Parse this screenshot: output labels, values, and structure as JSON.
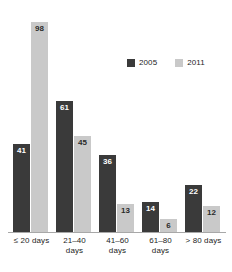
{
  "chart_data": {
    "type": "bar",
    "title": "",
    "subtitle": "",
    "xlabel": "",
    "ylabel": "",
    "grid": false,
    "legend_position": "top-right",
    "ylim": [
      0,
      98
    ],
    "categories": [
      "≤ 20 days",
      "21–40 days",
      "41–60 days",
      "61–80 days",
      "> 80 days"
    ],
    "category_lines": [
      [
        "≤ 20 days"
      ],
      [
        "21–40",
        "days"
      ],
      [
        "41–60",
        "days"
      ],
      [
        "61–80",
        "days"
      ],
      [
        "> 80 days"
      ]
    ],
    "series": [
      {
        "name": "2005",
        "color": "#3a3a3a",
        "values": [
          41,
          61,
          36,
          14,
          22
        ]
      },
      {
        "name": "2011",
        "color": "#c9c9c9",
        "values": [
          98,
          45,
          13,
          6,
          12
        ]
      }
    ]
  },
  "legend": {
    "entries": [
      {
        "label": "2005",
        "color": "#3a3a3a"
      },
      {
        "label": "2011",
        "color": "#c9c9c9"
      }
    ]
  },
  "axis": {
    "baseline_color": "#a8a8a8"
  }
}
